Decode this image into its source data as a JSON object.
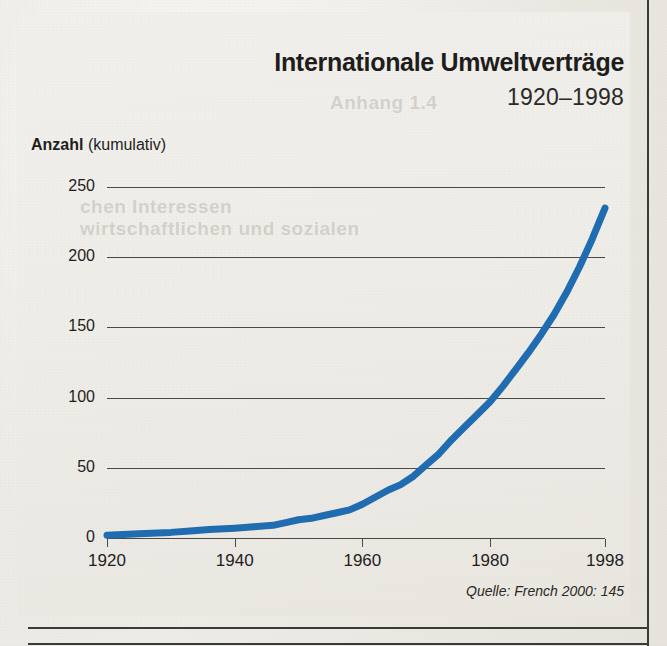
{
  "figure": {
    "title": "Internationale Umweltverträge",
    "subtitle": "1920–1998",
    "y_axis_caption_strong": "Anzahl",
    "y_axis_caption_light": "(kumulativ)",
    "source": "Quelle: French 2000: 145",
    "line_color": "#1f6cb0",
    "grid_color": "#4a4946",
    "paper_color": "#ebe8e2"
  },
  "ghost_text": {
    "line1": "Anhang 1.4",
    "line2": "chen Interessen",
    "line3": "wirtschaftlichen und sozialen"
  },
  "chart_data": {
    "type": "line",
    "title": "Internationale Umweltverträge",
    "subtitle": "1920–1998",
    "xlabel": "",
    "ylabel": "Anzahl (kumulativ)",
    "xlim": [
      1920,
      1998
    ],
    "ylim": [
      0,
      250
    ],
    "xticks": [
      1920,
      1940,
      1960,
      1980,
      1998
    ],
    "xtick_labels": [
      "1920",
      "1940",
      "1960",
      "1980",
      "1998"
    ],
    "yticks": [
      0,
      50,
      100,
      150,
      200,
      250
    ],
    "ytick_labels": [
      "0",
      "50",
      "100",
      "150",
      "200",
      "250"
    ],
    "grid": "horizontal",
    "legend": "none",
    "source_note": "Quelle: French 2000: 145",
    "series": [
      {
        "name": "Internationale Umweltverträge (kumulativ)",
        "color": "#1f6cb0",
        "x": [
          1920,
          1925,
          1930,
          1933,
          1936,
          1940,
          1943,
          1946,
          1948,
          1950,
          1952,
          1954,
          1956,
          1958,
          1960,
          1962,
          1964,
          1966,
          1968,
          1970,
          1972,
          1974,
          1976,
          1978,
          1980,
          1982,
          1984,
          1986,
          1988,
          1990,
          1992,
          1994,
          1996,
          1998
        ],
        "y": [
          2,
          3,
          4,
          5,
          6,
          7,
          8,
          9,
          11,
          13,
          14,
          16,
          18,
          20,
          24,
          29,
          34,
          38,
          44,
          52,
          60,
          70,
          79,
          88,
          97,
          108,
          120,
          132,
          145,
          159,
          175,
          193,
          213,
          235
        ]
      }
    ]
  }
}
